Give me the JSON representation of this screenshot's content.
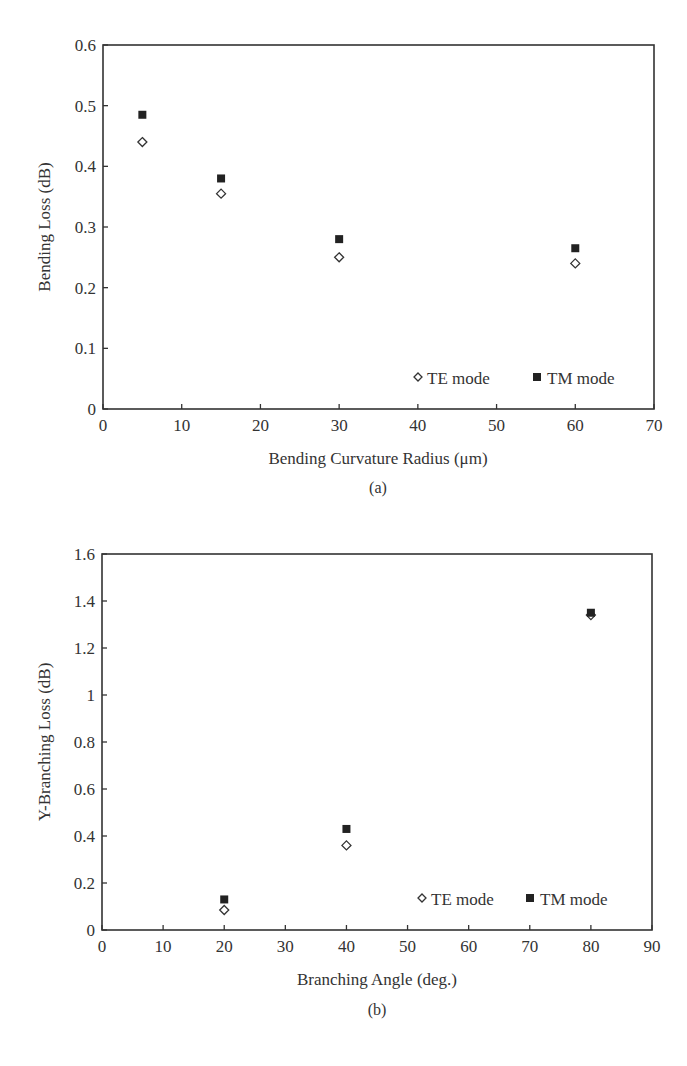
{
  "chart_data": [
    {
      "type": "scatter",
      "panel": "(a)",
      "title": "",
      "xlabel": "Bending Curvature Radius (μm)",
      "ylabel": "Bending Loss (dB)",
      "xlim": [
        0,
        70
      ],
      "ylim": [
        0,
        0.6
      ],
      "xticks": [
        0,
        10,
        20,
        30,
        40,
        50,
        60,
        70
      ],
      "yticks": [
        0,
        0.1,
        0.2,
        0.3,
        0.4,
        0.5,
        0.6
      ],
      "xtick_labels": [
        "0",
        "10",
        "20",
        "30",
        "40",
        "50",
        "60",
        "70"
      ],
      "ytick_labels": [
        "0",
        "0.1",
        "0.2",
        "0.3",
        "0.4",
        "0.5",
        "0.6"
      ],
      "grid": false,
      "legend_position": "lower right",
      "x": [
        5,
        15,
        30,
        60
      ],
      "series": [
        {
          "name": "TE mode",
          "marker": "open-diamond",
          "values": [
            0.44,
            0.355,
            0.25,
            0.24
          ]
        },
        {
          "name": "TM mode",
          "marker": "filled-square",
          "values": [
            0.485,
            0.38,
            0.28,
            0.265
          ]
        }
      ]
    },
    {
      "type": "scatter",
      "panel": "(b)",
      "title": "",
      "xlabel": "Branching Angle (deg.)",
      "ylabel": "Y-Branching Loss (dB)",
      "xlim": [
        0,
        90
      ],
      "ylim": [
        0,
        1.6
      ],
      "xticks": [
        0,
        10,
        20,
        30,
        40,
        50,
        60,
        70,
        80,
        90
      ],
      "yticks": [
        0,
        0.2,
        0.4,
        0.6,
        0.8,
        1,
        1.2,
        1.4,
        1.6
      ],
      "xtick_labels": [
        "0",
        "10",
        "20",
        "30",
        "40",
        "50",
        "60",
        "70",
        "80",
        "90"
      ],
      "ytick_labels": [
        "0",
        "0.2",
        "0.4",
        "0.6",
        "0.8",
        "1",
        "1.2",
        "1.4",
        "1.6"
      ],
      "grid": false,
      "legend_position": "lower right",
      "x": [
        20,
        40,
        80
      ],
      "series": [
        {
          "name": "TE mode",
          "marker": "open-diamond",
          "values": [
            0.085,
            0.36,
            1.34
          ]
        },
        {
          "name": "TM mode",
          "marker": "filled-square",
          "values": [
            0.13,
            0.43,
            1.35
          ]
        }
      ]
    }
  ],
  "panels": {
    "a": {
      "caption": "(a)",
      "xlabel": "Bending Curvature Radius (μm)",
      "ylabel": "Bending Loss (dB)",
      "legend": {
        "te": "TE mode",
        "tm": "TM mode"
      }
    },
    "b": {
      "caption": "(b)",
      "xlabel": "Branching Angle (deg.)",
      "ylabel": "Y-Branching Loss (dB)",
      "legend": {
        "te": "TE mode",
        "tm": "TM mode"
      }
    }
  },
  "colors": {
    "axis": "#333333",
    "marker": "#222222",
    "background": "#ffffff"
  }
}
